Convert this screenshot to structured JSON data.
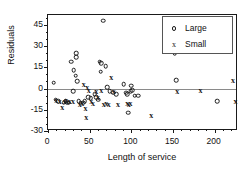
{
  "chart_data": {
    "type": "scatter",
    "title": "",
    "xlabel": "Length of service",
    "ylabel": "Residuals",
    "xlim": [
      0,
      228
    ],
    "ylim": [
      -30,
      52
    ],
    "xticks": [
      0,
      50,
      100,
      150,
      200
    ],
    "yticks": [
      45,
      30,
      15,
      0,
      -15,
      -30
    ],
    "grid": false,
    "legend_position": "top-right",
    "reference_line_y": 0,
    "series": [
      {
        "name": "Large",
        "marker": "circle",
        "points": [
          [
            7,
            4
          ],
          [
            9,
            -8
          ],
          [
            12,
            -9
          ],
          [
            19,
            -10
          ],
          [
            21,
            -9
          ],
          [
            23,
            -10
          ],
          [
            25,
            -10
          ],
          [
            28,
            19
          ],
          [
            30,
            -2
          ],
          [
            31,
            13
          ],
          [
            33,
            9
          ],
          [
            34,
            25
          ],
          [
            34,
            22
          ],
          [
            35,
            5
          ],
          [
            37,
            -9
          ],
          [
            39,
            -10
          ],
          [
            42,
            -10
          ],
          [
            44,
            -9
          ],
          [
            48,
            -6
          ],
          [
            51,
            -7
          ],
          [
            56,
            -4
          ],
          [
            58,
            -6
          ],
          [
            60,
            -8
          ],
          [
            62,
            19
          ],
          [
            63,
            12
          ],
          [
            64,
            18
          ],
          [
            66,
            48
          ],
          [
            69,
            16
          ],
          [
            71,
            1
          ],
          [
            74,
            -2
          ],
          [
            78,
            -3
          ],
          [
            82,
            -4
          ],
          [
            91,
            3
          ],
          [
            94,
            -3
          ],
          [
            95,
            -4
          ],
          [
            96,
            -17
          ],
          [
            99,
            -2
          ],
          [
            100,
            2
          ],
          [
            101,
            -1
          ],
          [
            104,
            -5
          ],
          [
            108,
            -5
          ],
          [
            152,
            25
          ],
          [
            154,
            6
          ],
          [
            203,
            -9
          ]
        ]
      },
      {
        "name": "Small",
        "marker": "x",
        "points": [
          [
            10,
            -8
          ],
          [
            14,
            -9
          ],
          [
            17,
            -13
          ],
          [
            20,
            -9
          ],
          [
            22,
            -8
          ],
          [
            26,
            -9
          ],
          [
            30,
            -9
          ],
          [
            38,
            -11
          ],
          [
            41,
            -10
          ],
          [
            43,
            3
          ],
          [
            45,
            -14
          ],
          [
            46,
            -20
          ],
          [
            47,
            1
          ],
          [
            49,
            -1
          ],
          [
            52,
            -9
          ],
          [
            54,
            -10
          ],
          [
            58,
            -2
          ],
          [
            60,
            -6
          ],
          [
            64,
            -1
          ],
          [
            67,
            -11
          ],
          [
            70,
            -10
          ],
          [
            73,
            -11
          ],
          [
            76,
            8
          ],
          [
            79,
            -2
          ],
          [
            84,
            -11
          ],
          [
            95,
            -10
          ],
          [
            97,
            -11
          ],
          [
            99,
            -10
          ],
          [
            124,
            -19
          ],
          [
            155,
            -2
          ],
          [
            183,
            -1
          ],
          [
            222,
            6
          ],
          [
            225,
            -9
          ]
        ]
      }
    ]
  },
  "legend": {
    "entries": [
      {
        "label": "Large",
        "marker": "circle-icon"
      },
      {
        "label": "Small",
        "marker": "x-icon"
      }
    ]
  }
}
